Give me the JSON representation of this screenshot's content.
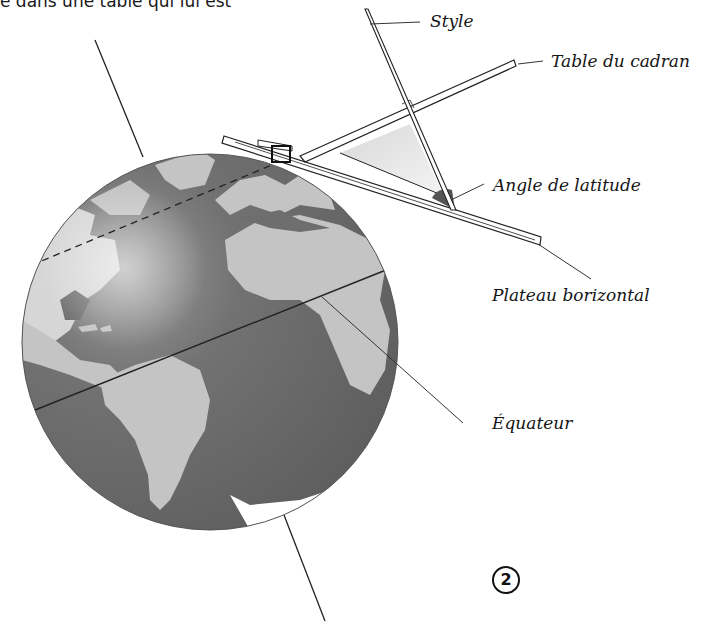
{
  "intro_text": "e dans une table qui lui est",
  "labels": {
    "style": "Style",
    "table": "Table du cadran",
    "angle": "Angle de latitude",
    "plateau": "Plateau borizontal",
    "equateur": "Équateur"
  },
  "figure_number": "2",
  "colors": {
    "ocean": "#6e6e6e",
    "land": "#c4c4c4",
    "highlight": "#e8e8e8",
    "line": "#222222",
    "triangle_fill": "#e6e6e6",
    "angle_fill": "#555555"
  }
}
